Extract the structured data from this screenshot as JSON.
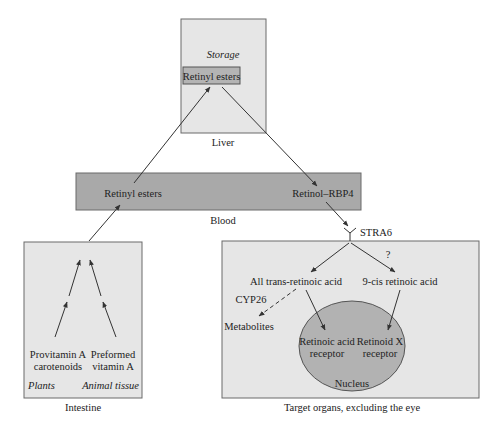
{
  "colors": {
    "background": "#ffffff",
    "box_fill": "#e6e6e6",
    "box_stroke": "#6a6a6a",
    "blood_fill": "#a9a9a9",
    "inner_box_fill": "#b4b4b4",
    "nucleus_fill": "#b2b2b2",
    "arrow": "#333333"
  },
  "liver": {
    "caption": "Liver",
    "storage_label": "Storage",
    "retinyl_esters": "Retinyl esters"
  },
  "blood": {
    "caption": "Blood",
    "retinyl_esters": "Retinyl esters",
    "retinol_rbp4": "Retinol–RBP4"
  },
  "intestine": {
    "caption": "Intestine",
    "provitamin_line1": "Provitamin A",
    "provitamin_line2": "carotenoids",
    "preformed_line1": "Preformed",
    "preformed_line2": "vitamin A",
    "plants": "Plants",
    "animal_tissue": "Animal tissue"
  },
  "target": {
    "caption": "Target organs, excluding the eye",
    "receptor": "STRA6",
    "question_mark": "?",
    "all_trans": "All trans-retinoic acid",
    "nine_cis": "9-cis retinoic acid",
    "cyp26": "CYP26",
    "metabolites": "Metabolites",
    "rar_line1": "Retinoic acid",
    "rar_line2": "receptor",
    "rxr_line1": "Retinoid X",
    "rxr_line2": "receptor",
    "nucleus": "Nucleus"
  }
}
